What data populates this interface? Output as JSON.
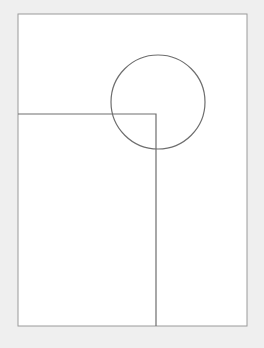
{
  "canvas": {
    "width": 264,
    "height": 348,
    "background": "#efefef"
  },
  "frame": {
    "x": 18,
    "y": 14,
    "width": 229,
    "height": 312,
    "fill": "#ffffff",
    "stroke": "#9a9a9a"
  },
  "l_shape": {
    "start": [
      18,
      114
    ],
    "corner": [
      156,
      114
    ],
    "end": [
      156,
      326
    ],
    "stroke": "#6e6e6e"
  },
  "circle": {
    "cx": 158,
    "cy": 102,
    "r": 47,
    "stroke": "#6e6e6e"
  }
}
